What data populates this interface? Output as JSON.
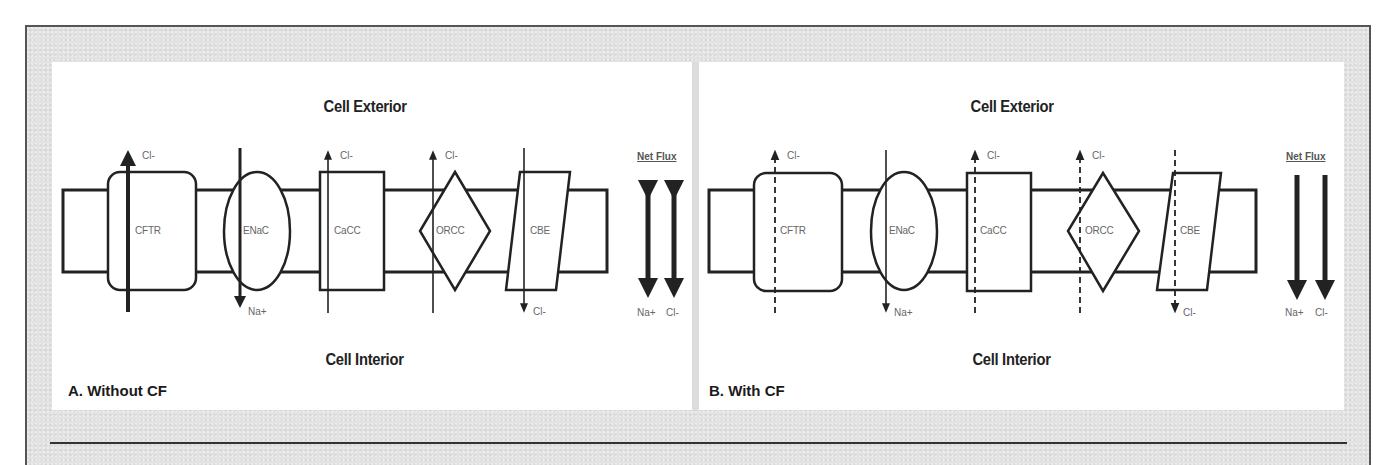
{
  "figure": {
    "panels": [
      {
        "id": "A",
        "label": "A. Without CF",
        "exterior_label": "Cell Exterior",
        "interior_label": "Cell Interior",
        "net_flux_label": "Net Flux",
        "channels": [
          {
            "name": "CFTR",
            "shape": "rounded-rect",
            "ion": "Cl-",
            "direction": "out",
            "flow": "strong"
          },
          {
            "name": "ENaC",
            "shape": "ellipse",
            "ion": "Na+",
            "direction": "in",
            "flow": "strong"
          },
          {
            "name": "CaCC",
            "shape": "rect",
            "ion": "Cl-",
            "direction": "out",
            "flow": "normal"
          },
          {
            "name": "ORCC",
            "shape": "diamond",
            "ion": "Cl-",
            "direction": "out",
            "flow": "normal"
          },
          {
            "name": "CBE",
            "shape": "parallelogram",
            "ion": "Cl-",
            "direction": "in",
            "flow": "normal"
          }
        ],
        "net_flux": [
          {
            "ion": "Na+",
            "direction": "bidirectional"
          },
          {
            "ion": "Cl-",
            "direction": "bidirectional"
          }
        ]
      },
      {
        "id": "B",
        "label": "B. With CF",
        "exterior_label": "Cell Exterior",
        "interior_label": "Cell Interior",
        "net_flux_label": "Net Flux",
        "channels": [
          {
            "name": "CFTR",
            "shape": "rounded-rect",
            "ion": "Cl-",
            "direction": "out",
            "flow": "impaired"
          },
          {
            "name": "ENaC",
            "shape": "ellipse",
            "ion": "Na+",
            "direction": "in",
            "flow": "normal"
          },
          {
            "name": "CaCC",
            "shape": "rect",
            "ion": "Cl-",
            "direction": "out",
            "flow": "impaired"
          },
          {
            "name": "ORCC",
            "shape": "diamond",
            "ion": "Cl-",
            "direction": "out",
            "flow": "impaired"
          },
          {
            "name": "CBE",
            "shape": "parallelogram",
            "ion": "Cl-",
            "direction": "in",
            "flow": "impaired"
          }
        ],
        "net_flux": [
          {
            "ion": "Na+",
            "direction": "in"
          },
          {
            "ion": "Cl-",
            "direction": "in"
          }
        ]
      }
    ],
    "colors": {
      "stroke": "#222222",
      "frame_bg": "#e2e2e2",
      "panel_bg": "#ffffff",
      "label_gray": "#666666"
    }
  }
}
